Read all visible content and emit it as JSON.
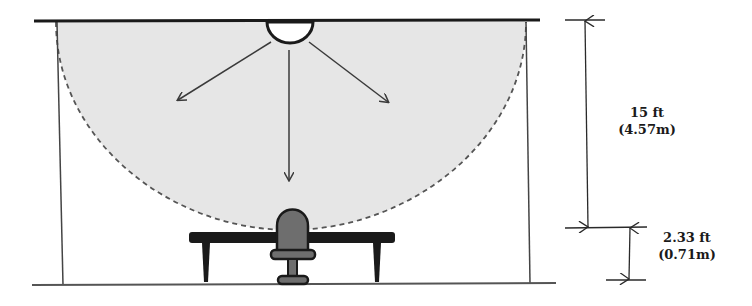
{
  "diagram": {
    "colors": {
      "line": "#2a2a2a",
      "coverage_fill": "#e6e6e6",
      "coverage_edge": "#555555",
      "chair_fill": "#6e6e6e",
      "sensor_fill": "#ffffff"
    },
    "dimensions": {
      "ceiling_to_desk": {
        "imperial": "15 ft",
        "metric": "(4.57m)"
      },
      "desk_to_floor": {
        "imperial": "2.33 ft",
        "metric": "(0.71m)"
      }
    },
    "elements": [
      "ceiling",
      "floor",
      "left-wall",
      "right-wall",
      "ceiling-sensor",
      "coverage-area",
      "arrow-left",
      "arrow-down",
      "arrow-right",
      "desk",
      "chair"
    ]
  }
}
